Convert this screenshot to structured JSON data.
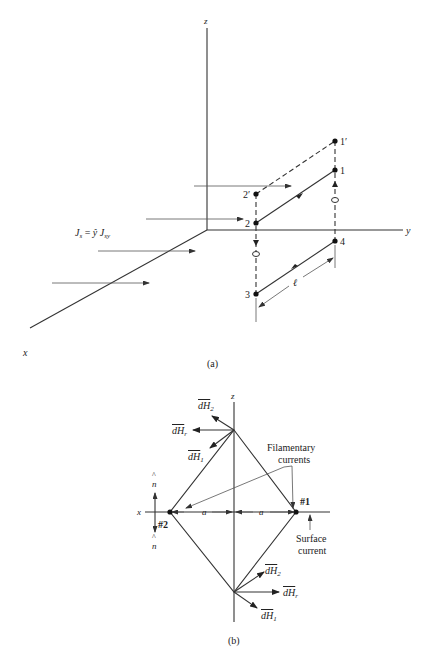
{
  "figure_a": {
    "caption": "(a)",
    "axes": {
      "x": "x",
      "y": "y",
      "z": "z"
    },
    "current_label": {
      "J": "J",
      "s": "s",
      "eq": " = ",
      "yhat": "ŷ",
      "J2": "J",
      "sy": "sy"
    },
    "points": {
      "p1prime": "1′",
      "p1": "1",
      "p2prime": "2′",
      "p2": "2",
      "p3": "3",
      "p4": "4"
    },
    "length_label": "ℓ"
  },
  "figure_b": {
    "caption": "(b)",
    "axes": {
      "x": "x",
      "z": "z"
    },
    "top_vectors": {
      "dH2": "dH",
      "dH2_sub": "2",
      "dHr": "dH",
      "dHr_sub": "r",
      "dH1": "dH",
      "dH1_sub": "1"
    },
    "bottom_vectors": {
      "dH2": "dH",
      "dH2_sub": "2",
      "dHr": "dH",
      "dHr_sub": "r",
      "dH1": "dH",
      "dH1_sub": "1"
    },
    "filament_label_line1": "Filamentary",
    "filament_label_line2": "currents",
    "surface_label_line1": "Surface",
    "surface_label_line2": "current",
    "point1": "#1",
    "point2": "#2",
    "dist_a_left": "a",
    "dist_a_right": "a",
    "normal_up": "n",
    "normal_down": "n",
    "hat": "^"
  }
}
